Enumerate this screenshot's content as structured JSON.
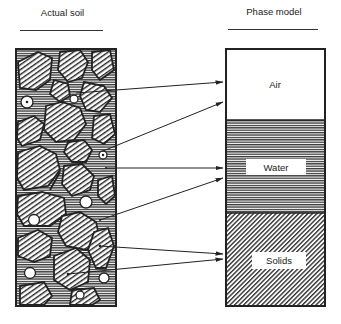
{
  "left_panel": {
    "title": "Actual soil"
  },
  "right_panel": {
    "title": "Phase model",
    "phases": [
      {
        "name": "air",
        "label": "Air"
      },
      {
        "name": "water",
        "label": "Water"
      },
      {
        "name": "solids",
        "label": "Solids"
      }
    ]
  }
}
